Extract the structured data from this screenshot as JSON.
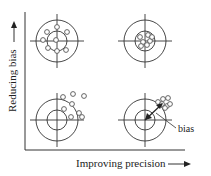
{
  "diagram": {
    "y_axis_label": "Reducing bias",
    "x_axis_label": "Improving precision",
    "annotation": "bias",
    "colors": {
      "line": "#333333",
      "marker": "#555555",
      "background": "#ffffff"
    },
    "targets": [
      {
        "name": "high-bias-low-precision-unbiased",
        "position": "top-left",
        "cx": 57,
        "cy": 41,
        "points": [
          [
            57,
            27
          ],
          [
            47,
            32
          ],
          [
            67,
            32
          ],
          [
            56,
            40
          ],
          [
            48,
            48
          ],
          [
            57,
            51
          ],
          [
            66,
            50
          ],
          [
            43,
            40
          ]
        ]
      },
      {
        "name": "unbiased-precise",
        "position": "top-right",
        "cx": 145,
        "cy": 41,
        "points": [
          [
            140,
            37
          ],
          [
            148,
            35
          ],
          [
            143,
            42
          ],
          [
            150,
            41
          ],
          [
            141,
            46
          ],
          [
            147,
            45
          ],
          [
            152,
            37
          ]
        ]
      },
      {
        "name": "biased-imprecise",
        "position": "bottom-left",
        "cx": 57,
        "cy": 120,
        "points": [
          [
            63,
            97
          ],
          [
            73,
            94
          ],
          [
            84,
            96
          ],
          [
            72,
            104
          ],
          [
            64,
            109
          ],
          [
            79,
            113
          ],
          [
            71,
            117
          ],
          [
            82,
            117
          ]
        ]
      },
      {
        "name": "biased-precise",
        "position": "bottom-right",
        "cx": 145,
        "cy": 120,
        "points": [
          [
            158,
            102
          ],
          [
            163,
            99
          ],
          [
            168,
            98
          ],
          [
            162,
            104
          ],
          [
            167,
            106
          ],
          [
            170,
            104
          ],
          [
            165,
            108
          ]
        ]
      }
    ]
  }
}
